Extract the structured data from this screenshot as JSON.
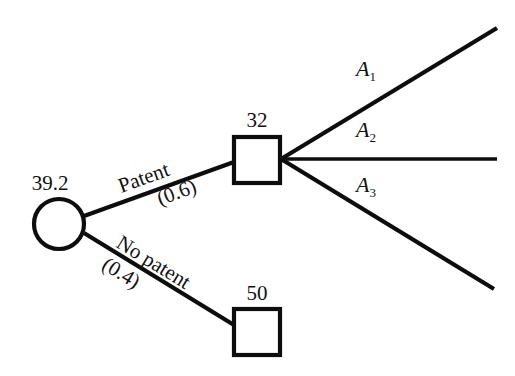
{
  "diagram": {
    "type": "decision-tree",
    "background_color": "#ffffff",
    "line_color": "#0d0d0d"
  },
  "nodes": {
    "chance_root": {
      "shape": "circle",
      "value_label": "39.2",
      "cx": 59,
      "cy": 224,
      "r": 25
    },
    "decision_patent": {
      "shape": "square",
      "value_label": "32",
      "x": 234,
      "y": 137,
      "size": 46
    },
    "terminal_no_patent": {
      "shape": "square",
      "value_label": "50",
      "x": 234,
      "y": 309,
      "size": 46
    }
  },
  "branches": [
    {
      "id": "patent",
      "label": "Patent",
      "probability": "(0.6)",
      "from": "chance_root",
      "to": "decision_patent"
    },
    {
      "id": "no-patent",
      "label": "No patent",
      "probability": "(0.4)",
      "from": "chance_root",
      "to": "terminal_no_patent"
    }
  ],
  "actions": [
    {
      "id": "a1",
      "label": "A",
      "subscript": "1"
    },
    {
      "id": "a2",
      "label": "A",
      "subscript": "2"
    },
    {
      "id": "a3",
      "label": "A",
      "subscript": "3"
    }
  ]
}
